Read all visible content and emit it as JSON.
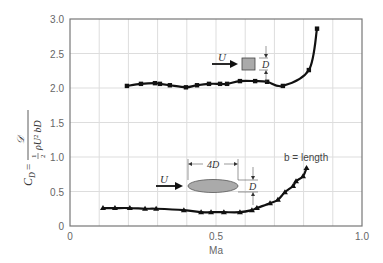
{
  "chart_data": {
    "type": "line",
    "title": "",
    "xlabel": "Ma",
    "ylabel": "C_D = 𝒟 / (½ ρ U² b D)",
    "xlim": [
      0,
      1.0
    ],
    "ylim": [
      0,
      3.0
    ],
    "xticks": [
      "0",
      "0.5",
      "1.0"
    ],
    "yticks": [
      "0",
      "0.5",
      "1.0",
      "1.5",
      "2.0",
      "2.5",
      "3.0"
    ],
    "grid": true,
    "series": [
      {
        "name": "Square cylinder",
        "marker": "square",
        "x": [
          0.195,
          0.243,
          0.291,
          0.308,
          0.342,
          0.397,
          0.435,
          0.476,
          0.514,
          0.538,
          0.582,
          0.634,
          0.675,
          0.729,
          0.818,
          0.846
        ],
        "y": [
          2.03,
          2.06,
          2.07,
          2.06,
          2.04,
          2.01,
          2.04,
          2.06,
          2.06,
          2.06,
          2.1,
          2.1,
          2.09,
          2.03,
          2.26,
          2.86
        ]
      },
      {
        "name": "Elliptical cylinder (4D x D)",
        "marker": "triangle",
        "x": [
          0.113,
          0.154,
          0.205,
          0.257,
          0.295,
          0.39,
          0.449,
          0.483,
          0.527,
          0.582,
          0.623,
          0.64,
          0.685,
          0.712,
          0.736,
          0.764,
          0.774,
          0.798,
          0.81
        ],
        "y": [
          0.26,
          0.26,
          0.26,
          0.25,
          0.25,
          0.23,
          0.2,
          0.2,
          0.2,
          0.2,
          0.23,
          0.26,
          0.33,
          0.38,
          0.49,
          0.58,
          0.65,
          0.72,
          0.84
        ]
      }
    ],
    "annotations": {
      "flow_label": "U",
      "square_dim": "D",
      "ellipse_length": "4D",
      "ellipse_dim": "D",
      "span_note": "b = length"
    }
  },
  "ylabel_parts": {
    "cd": "C",
    "cd_sub": "D",
    "eq": "=",
    "num": "𝒟",
    "half_n": "1",
    "half_d": "2",
    "denom": "ρU² bD"
  }
}
